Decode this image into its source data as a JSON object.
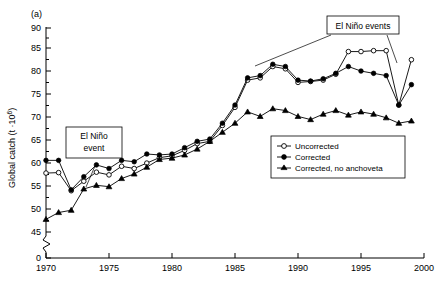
{
  "panel": {
    "label": "(a)"
  },
  "axes": {
    "ylabel": "Global catch (t ·10",
    "ylabel_sup": "6",
    "ylabel_tail": ")",
    "y_ticks": [
      "0",
      "45",
      "50",
      "55",
      "60",
      "65",
      "70",
      "75",
      "80",
      "85",
      "90"
    ],
    "x_ticks": [
      "1970",
      "1975",
      "1980",
      "1985",
      "1990",
      "1995",
      "2000"
    ],
    "axis_break": true
  },
  "legend": {
    "items": [
      {
        "label": "Uncorrected",
        "marker": "open-circle"
      },
      {
        "label": "Corrected",
        "marker": "filled-circle"
      },
      {
        "label": "Corrected, no anchoveta",
        "marker": "filled-triangle"
      }
    ]
  },
  "annotations": [
    {
      "name": "el-nino-event-left",
      "line1": "El Niño",
      "line2": "event"
    },
    {
      "name": "el-nino-events-right",
      "line1": "El Niño events",
      "line2": ""
    }
  ],
  "chart_data": {
    "type": "line",
    "title": "",
    "xlabel": "",
    "ylabel": "Global catch (t ·10^6)",
    "xlim": [
      1970,
      2000
    ],
    "ylim": [
      43,
      90
    ],
    "grid": false,
    "legend_position": "inside-right-lower",
    "x": [
      1970,
      1971,
      1972,
      1973,
      1974,
      1975,
      1976,
      1977,
      1978,
      1979,
      1980,
      1981,
      1982,
      1983,
      1984,
      1985,
      1986,
      1987,
      1988,
      1989,
      1990,
      1991,
      1992,
      1993,
      1994,
      1995,
      1996,
      1997,
      1998,
      1999
    ],
    "series": [
      {
        "name": "Uncorrected",
        "marker": "open-circle",
        "values": [
          58.0,
          58.1,
          54.1,
          56.2,
          58.2,
          57.6,
          59.5,
          59.0,
          60.2,
          61.4,
          61.8,
          63.0,
          64.5,
          65.0,
          68.5,
          72.5,
          78.5,
          79.0,
          81.5,
          81.0,
          78.0,
          78.2,
          78.5,
          79.8,
          84.8,
          84.8,
          85.0,
          85.0,
          73.0,
          83.0
        ]
      },
      {
        "name": "Corrected",
        "marker": "filled-circle",
        "values": [
          60.8,
          60.8,
          54.3,
          57.2,
          59.8,
          59.0,
          60.8,
          60.5,
          62.2,
          62.0,
          62.2,
          63.6,
          65.0,
          65.5,
          69.0,
          73.0,
          79.0,
          79.5,
          82.0,
          81.5,
          78.5,
          78.3,
          78.8,
          80.0,
          81.5,
          80.5,
          80.0,
          79.5,
          73.0,
          77.5
        ]
      },
      {
        "name": "Corrected, no anchoveta",
        "marker": "filled-triangle",
        "values": [
          47.8,
          49.3,
          49.8,
          54.5,
          55.3,
          55.0,
          56.8,
          57.8,
          59.3,
          61.0,
          61.3,
          62.0,
          63.3,
          65.0,
          67.0,
          69.0,
          71.5,
          70.5,
          72.2,
          71.8,
          70.5,
          69.8,
          71.0,
          71.8,
          70.8,
          71.5,
          71.0,
          70.2,
          69.0,
          69.5
        ]
      }
    ],
    "annotations": [
      {
        "text": "El Niño event",
        "points_to_year": 1973
      },
      {
        "text": "El Niño events",
        "points_to_years": [
          1986,
          1998
        ]
      }
    ]
  }
}
